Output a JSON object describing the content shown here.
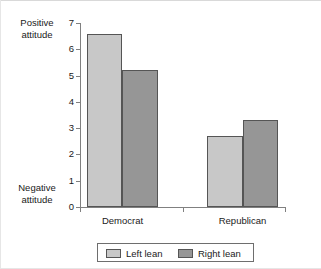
{
  "chart_data": {
    "type": "bar",
    "title": "",
    "categories": [
      "Democrat",
      "Republican"
    ],
    "series": [
      {
        "name": "Left lean",
        "values": [
          6.6,
          2.7
        ],
        "color": "#c8c8c8"
      },
      {
        "name": "Right lean",
        "values": [
          5.2,
          3.3
        ],
        "color": "#969696"
      }
    ],
    "xlabel": "",
    "ylabel": "",
    "ylim": [
      0,
      7
    ],
    "yticks": [
      0,
      1,
      2,
      3,
      4,
      5,
      6,
      7
    ],
    "ytick_labels": [
      "0",
      "1",
      "2",
      "3",
      "4",
      "5",
      "6",
      "7"
    ],
    "y_axis_top_annotation": "Positive attitude",
    "y_axis_bottom_annotation": "Negative attitude",
    "grid": false,
    "legend_position": "bottom"
  },
  "axis_titles": {
    "positive_line1": "Positive",
    "positive_line2": "attitude",
    "negative_line1": "Negative",
    "negative_line2": "attitude"
  },
  "y_labels": [
    "7",
    "6",
    "5",
    "4",
    "3",
    "2",
    "1",
    "0"
  ],
  "x_labels": [
    "Democrat",
    "Republican"
  ],
  "legend": {
    "items": [
      {
        "label": "Left lean"
      },
      {
        "label": "Right lean"
      }
    ]
  },
  "colors": {
    "light_bar": "#c8c8c8",
    "dark_bar": "#969696",
    "bar_border": "#555555",
    "axis": "#808080",
    "text": "#1a1a1a",
    "background": "#ffffff"
  }
}
